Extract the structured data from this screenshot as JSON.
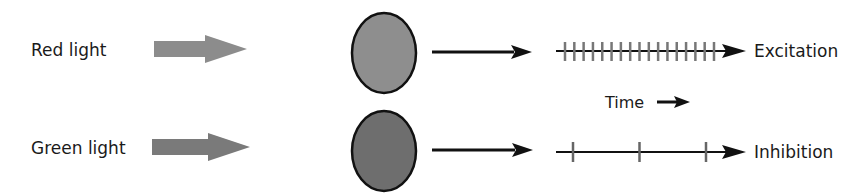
{
  "rows": [
    {
      "id": "red",
      "stimulus_label": "Red light",
      "stimulus_arrow_color": "#8c8c8c",
      "cell_fill": "#8e8e8e",
      "response_label": "Excitation",
      "spike_count": 17,
      "spike_start_x": 565,
      "spike_end_x": 714
    },
    {
      "id": "green",
      "stimulus_label": "Green light",
      "stimulus_arrow_color": "#7a7a7a",
      "cell_fill": "#6e6e6e",
      "response_label": "Inhibition",
      "spike_count": 3,
      "spike_start_x": 573,
      "spike_end_x": 706
    }
  ],
  "time_axis": {
    "label": "Time"
  },
  "colors": {
    "line": "#111111",
    "spike": "#777777",
    "cell_outline": "#111111"
  }
}
